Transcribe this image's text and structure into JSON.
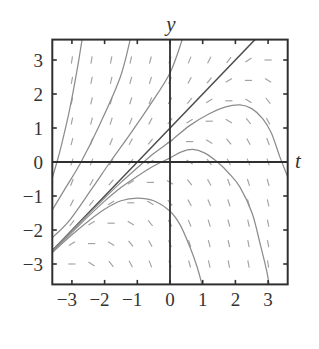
{
  "colors": {
    "background": "#ffffff",
    "frame": "#2f2f2f",
    "axes": "#2f2f2f",
    "slope_dash": "#a2a2a2",
    "solution_curve": "#8c8c8c",
    "straight_solution": "#4d4d4d",
    "text": "#333333"
  },
  "chart_data": {
    "type": "slope_field",
    "title": "",
    "xlabel": "t",
    "ylabel": "y",
    "xlim": [
      -3.6,
      3.6
    ],
    "ylim": [
      -3.6,
      3.6
    ],
    "grid": false,
    "legend": null,
    "xticks": [
      -3,
      -2,
      -1,
      0,
      1,
      2,
      3
    ],
    "xtick_labels": [
      "−3",
      "−2",
      "−1",
      "0",
      "1",
      "2",
      "3"
    ],
    "yticks": [
      3,
      2,
      1,
      0,
      -1,
      -2,
      -3
    ],
    "ytick_labels": [
      "3",
      "2",
      "1",
      "0",
      "−1",
      "−2",
      "−3"
    ],
    "slope_field": {
      "t_values": [
        -3,
        -2.4,
        -1.8,
        -1.2,
        -0.6,
        0,
        0.6,
        1.2,
        1.8,
        2.4,
        3
      ],
      "y_values": [
        3,
        2.4,
        1.8,
        1.2,
        0.6,
        0,
        -0.6,
        -1.2,
        -1.8,
        -2.4,
        -3
      ],
      "slopes": [
        [
          6,
          5.4,
          4.8,
          4.2,
          3.6,
          3,
          2.4,
          1.8,
          1.2,
          0.6,
          0
        ],
        [
          5.4,
          4.8,
          4.2,
          3.6,
          3,
          2.4,
          1.8,
          1.2,
          0.6,
          0,
          -0.6
        ],
        [
          4.8,
          4.2,
          3.6,
          3,
          2.4,
          1.8,
          1.2,
          0.6,
          0,
          -0.6,
          -1.2
        ],
        [
          4.2,
          3.6,
          3,
          2.4,
          1.8,
          1.2,
          0.6,
          0,
          -0.6,
          -1.2,
          -1.8
        ],
        [
          3.6,
          3,
          2.4,
          1.8,
          1.2,
          0.6,
          0,
          -0.6,
          -1.2,
          -1.8,
          -2.4
        ],
        [
          3,
          2.4,
          1.8,
          1.2,
          0.6,
          0,
          -0.6,
          -1.2,
          -1.8,
          -2.4,
          -3
        ],
        [
          2.4,
          1.8,
          1.2,
          0.6,
          0,
          -0.6,
          -1.2,
          -1.8,
          -2.4,
          -3,
          -3.6
        ],
        [
          1.8,
          1.2,
          0.6,
          0,
          -0.6,
          -1.2,
          -1.8,
          -2.4,
          -3,
          -3.6,
          -4.2
        ],
        [
          1.2,
          0.6,
          0,
          -0.6,
          -1.2,
          -1.8,
          -2.4,
          -3,
          -3.6,
          -4.2,
          -4.8
        ],
        [
          0.6,
          0,
          -0.6,
          -1.2,
          -1.8,
          -2.4,
          -3,
          -3.6,
          -4.2,
          -4.8,
          -5.4
        ],
        [
          0,
          -0.6,
          -1.2,
          -1.8,
          -2.4,
          -3,
          -3.6,
          -4.2,
          -4.8,
          -5.4,
          -6
        ]
      ]
    },
    "series": [
      {
        "name": "straight-line-solution",
        "style": "dark",
        "points": [
          [
            -3.7,
            -2.7
          ],
          [
            2.75,
            3.75
          ]
        ]
      },
      {
        "name": "solution-upper-1",
        "style": "gray",
        "points": [
          [
            -3.7,
            -0.78
          ],
          [
            -3.6,
            -0.47
          ],
          [
            -3.5,
            -0.14
          ],
          [
            -3.4,
            0.2
          ],
          [
            -3.3,
            0.58
          ],
          [
            -3.2,
            0.98
          ],
          [
            -3.1,
            1.41
          ],
          [
            -3.0,
            1.88
          ],
          [
            -2.9,
            2.39
          ],
          [
            -2.8,
            2.94
          ],
          [
            -2.7,
            3.54
          ],
          [
            -2.66,
            3.8
          ]
        ]
      },
      {
        "name": "solution-upper-2",
        "style": "gray",
        "points": [
          [
            -3.65,
            -1.49
          ],
          [
            -3.58,
            -1.38
          ],
          [
            -3.18,
            -0.74
          ],
          [
            -2.72,
            0
          ],
          [
            -2.14,
            1.12
          ],
          [
            -1.53,
            2.47
          ],
          [
            -1.22,
            3.59
          ],
          [
            -1.18,
            3.8
          ]
        ]
      },
      {
        "name": "solution-upper-3",
        "style": "gray",
        "points": [
          [
            -3.65,
            -2.27
          ],
          [
            -3.58,
            -2.21
          ],
          [
            -3.06,
            -1.7
          ],
          [
            -2.4,
            -0.8
          ],
          [
            -1.83,
            0
          ],
          [
            -1.22,
            0.82
          ],
          [
            -0.61,
            1.68
          ],
          [
            0,
            2.62
          ],
          [
            0.37,
            3.59
          ],
          [
            0.42,
            3.8
          ]
        ]
      },
      {
        "name": "solution-lower-1",
        "style": "gray",
        "points": [
          [
            -3.65,
            -2.66
          ],
          [
            -3.6,
            -2.61
          ],
          [
            -3.0,
            -2.02
          ],
          [
            -2.5,
            -1.54
          ],
          [
            -2.0,
            -1.06
          ],
          [
            -1.5,
            -0.6
          ],
          [
            -1.0,
            -0.17
          ],
          [
            -0.5,
            0.25
          ],
          [
            0,
            0.6
          ],
          [
            0.6,
            1.07
          ],
          [
            1.2,
            1.42
          ],
          [
            1.7,
            1.62
          ],
          [
            2.14,
            1.68
          ],
          [
            2.5,
            1.57
          ],
          [
            2.84,
            1.27
          ],
          [
            3.1,
            0.85
          ],
          [
            3.36,
            0.15
          ],
          [
            3.6,
            -0.44
          ],
          [
            3.7,
            -0.75
          ]
        ]
      },
      {
        "name": "solution-lower-2",
        "style": "gray",
        "points": [
          [
            -3.65,
            -2.68
          ],
          [
            -3.6,
            -2.63
          ],
          [
            -3.0,
            -2.07
          ],
          [
            -2.5,
            -1.6
          ],
          [
            -2.0,
            -1.15
          ],
          [
            -1.5,
            -0.75
          ],
          [
            -1.0,
            -0.42
          ],
          [
            -0.5,
            -0.12
          ],
          [
            0,
            0.12
          ],
          [
            0.35,
            0.3
          ],
          [
            0.7,
            0.37
          ],
          [
            1.05,
            0.27
          ],
          [
            1.45,
            0
          ],
          [
            1.8,
            -0.33
          ],
          [
            2.14,
            -0.74
          ],
          [
            2.51,
            -1.5
          ],
          [
            2.75,
            -2.38
          ],
          [
            2.97,
            -3.26
          ],
          [
            3.05,
            -3.75
          ]
        ]
      },
      {
        "name": "solution-lower-3",
        "style": "gray",
        "points": [
          [
            -3.65,
            -2.7
          ],
          [
            -3.6,
            -2.66
          ],
          [
            -3.0,
            -2.14
          ],
          [
            -2.5,
            -1.74
          ],
          [
            -2.0,
            -1.39
          ],
          [
            -1.5,
            -1.14
          ],
          [
            -1.0,
            -1.06
          ],
          [
            -0.5,
            -1.14
          ],
          [
            0,
            -1.45
          ],
          [
            0.31,
            -1.85
          ],
          [
            0.61,
            -2.5
          ],
          [
            0.83,
            -3.09
          ],
          [
            1.02,
            -3.75
          ]
        ]
      }
    ]
  }
}
